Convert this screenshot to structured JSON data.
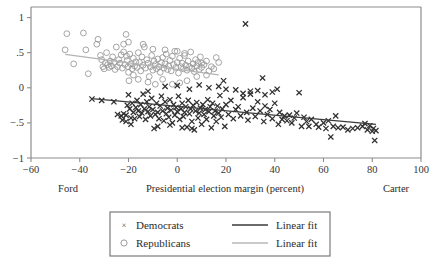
{
  "chart_data": {
    "type": "scatter",
    "title": "",
    "xlabel": "Presidential election margin (percent)",
    "ylabel": "",
    "xlim": [
      -60,
      100
    ],
    "ylim": [
      -1,
      1.15
    ],
    "xticks": [
      -60,
      -40,
      -20,
      0,
      20,
      40,
      60,
      80,
      100
    ],
    "xtick_labels": [
      "−60",
      "−40",
      "−20",
      "0",
      "20",
      "40",
      "60",
      "80",
      "100"
    ],
    "yticks": [
      1,
      0.5,
      0,
      -0.5,
      -1
    ],
    "ytick_labels": [
      "1",
      ".5",
      "0",
      "−.5",
      "−1"
    ],
    "grid": false,
    "axis_end_labels": {
      "left": "Ford",
      "right": "Carter"
    },
    "legend": {
      "position": "below-plot",
      "entries": [
        {
          "label": "Democrats",
          "marker": "x",
          "color": "#2f2f2f"
        },
        {
          "label": "Republicans",
          "marker": "o",
          "color": "#9a9a9a"
        },
        {
          "label": "Linear fit",
          "marker": "line",
          "color": "#3a3a3a"
        },
        {
          "label": "Linear fit",
          "marker": "line",
          "color": "#b3b3b3"
        }
      ]
    },
    "series": [
      {
        "name": "Republicans",
        "marker": "o",
        "color": "#9a9a9a",
        "points": [
          [
            -46.0,
            0.54
          ],
          [
            -45.3,
            0.77
          ],
          [
            -42.5,
            0.34
          ],
          [
            -38.5,
            0.78
          ],
          [
            -37.5,
            0.54
          ],
          [
            -36.5,
            0.2
          ],
          [
            -33.0,
            0.62
          ],
          [
            -32.5,
            0.69
          ],
          [
            -31.5,
            0.46
          ],
          [
            -31.0,
            0.4
          ],
          [
            -30.5,
            0.3
          ],
          [
            -30.0,
            0.27
          ],
          [
            -29.5,
            0.35
          ],
          [
            -29.0,
            0.5
          ],
          [
            -28.5,
            0.33
          ],
          [
            -28.0,
            0.29
          ],
          [
            -27.5,
            0.38
          ],
          [
            -27.0,
            0.31
          ],
          [
            -26.5,
            0.44
          ],
          [
            -26.0,
            0.36
          ],
          [
            -25.5,
            0.26
          ],
          [
            -25.0,
            0.58
          ],
          [
            -24.5,
            0.3
          ],
          [
            -24.0,
            0.4
          ],
          [
            -23.5,
            0.35
          ],
          [
            -23.0,
            0.47
          ],
          [
            -22.5,
            0.28
          ],
          [
            -22.0,
            0.51
          ],
          [
            -21.5,
            0.33
          ],
          [
            -21.0,
            0.76
          ],
          [
            -20.8,
            0.45
          ],
          [
            -20.5,
            0.39
          ],
          [
            -20.2,
            0.3
          ],
          [
            -20.0,
            0.22
          ],
          [
            -19.8,
            0.1
          ],
          [
            -19.5,
            0.48
          ],
          [
            -19.0,
            0.34
          ],
          [
            -18.5,
            0.27
          ],
          [
            -18.0,
            0.42
          ],
          [
            -17.5,
            0.31
          ],
          [
            -17.0,
            0.37
          ],
          [
            -16.5,
            0.29
          ],
          [
            -16.0,
            0.5
          ],
          [
            -15.5,
            0.36
          ],
          [
            -15.0,
            0.24
          ],
          [
            -14.5,
            0.44
          ],
          [
            -14.0,
            0.32
          ],
          [
            -13.5,
            0.58
          ],
          [
            -13.0,
            0.28
          ],
          [
            -12.5,
            0.4
          ],
          [
            -12.0,
            0.35
          ],
          [
            -11.5,
            0.16
          ],
          [
            -11.0,
            0.3
          ],
          [
            -10.5,
            0.46
          ],
          [
            -10.0,
            0.25
          ],
          [
            -9.5,
            0.38
          ],
          [
            -9.0,
            0.33
          ],
          [
            -8.5,
            0.27
          ],
          [
            -8.0,
            0.41
          ],
          [
            -7.5,
            0.3
          ],
          [
            -7.0,
            0.22
          ],
          [
            -6.5,
            0.36
          ],
          [
            -6.0,
            0.43
          ],
          [
            -5.5,
            0.28
          ],
          [
            -5.0,
            0.34
          ],
          [
            -4.5,
            0.48
          ],
          [
            -4.0,
            0.26
          ],
          [
            -3.5,
            0.31
          ],
          [
            -3.0,
            0.39
          ],
          [
            -2.5,
            0.24
          ],
          [
            -2.0,
            0.45
          ],
          [
            -1.5,
            0.33
          ],
          [
            -1.0,
            0.52
          ],
          [
            -0.5,
            0.29
          ],
          [
            0.0,
            0.36
          ],
          [
            0.5,
            0.21
          ],
          [
            1.0,
            0.42
          ],
          [
            1.5,
            0.3
          ],
          [
            2.0,
            0.35
          ],
          [
            2.5,
            0.27
          ],
          [
            3.0,
            0.46
          ],
          [
            3.5,
            0.32
          ],
          [
            4.0,
            0.25
          ],
          [
            4.5,
            0.38
          ],
          [
            5.0,
            0.3
          ],
          [
            5.5,
            0.51
          ],
          [
            6.0,
            0.28
          ],
          [
            6.5,
            0.34
          ],
          [
            7.0,
            0.23
          ],
          [
            7.5,
            0.4
          ],
          [
            8.0,
            0.31
          ],
          [
            8.5,
            0.36
          ],
          [
            9.0,
            0.26
          ],
          [
            9.5,
            0.44
          ],
          [
            10.0,
            0.29
          ],
          [
            11.0,
            0.33
          ],
          [
            12.0,
            0.38
          ],
          [
            13.0,
            0.24
          ],
          [
            14.0,
            0.3
          ],
          [
            15.0,
            0.27
          ],
          [
            16.0,
            0.43
          ],
          [
            17.0,
            0.36
          ],
          [
            -20.0,
            0.65
          ],
          [
            -22.0,
            0.62
          ],
          [
            -18.0,
            0.18
          ],
          [
            -16.0,
            0.12
          ],
          [
            -12.0,
            0.08
          ],
          [
            -9.0,
            0.05
          ],
          [
            -6.0,
            0.12
          ],
          [
            -2.0,
            0.05
          ],
          [
            1.0,
            0.07
          ],
          [
            4.0,
            0.1
          ],
          [
            8.0,
            0.16
          ],
          [
            12.0,
            0.18
          ],
          [
            -14.0,
            0.62
          ],
          [
            -10.0,
            0.55
          ],
          [
            -5.0,
            0.54
          ],
          [
            0.0,
            0.52
          ],
          [
            3.0,
            0.49
          ],
          [
            10.0,
            0.35
          ]
        ]
      },
      {
        "name": "Democrats",
        "marker": "x",
        "color": "#2f2f2f",
        "points": [
          [
            -35.0,
            -0.16
          ],
          [
            -31.0,
            -0.18
          ],
          [
            -26.0,
            -0.2
          ],
          [
            -24.5,
            -0.38
          ],
          [
            -23.0,
            -0.4
          ],
          [
            -22.5,
            -0.46
          ],
          [
            -22.0,
            -0.37
          ],
          [
            -21.0,
            -0.39
          ],
          [
            -20.5,
            -0.25
          ],
          [
            -20.0,
            -0.1
          ],
          [
            -19.5,
            -0.3
          ],
          [
            -19.0,
            -0.43
          ],
          [
            -18.5,
            -0.22
          ],
          [
            -18.0,
            -0.35
          ],
          [
            -17.5,
            -0.44
          ],
          [
            -17.0,
            -0.28
          ],
          [
            -16.5,
            -0.18
          ],
          [
            -16.0,
            -0.33
          ],
          [
            -15.5,
            -0.41
          ],
          [
            -15.0,
            -0.24
          ],
          [
            -14.5,
            -0.36
          ],
          [
            -14.0,
            -0.09
          ],
          [
            -13.5,
            -0.3
          ],
          [
            -13.0,
            -0.45
          ],
          [
            -12.5,
            -0.2
          ],
          [
            -12.0,
            -0.34
          ],
          [
            -11.5,
            -0.27
          ],
          [
            -11.0,
            -0.4
          ],
          [
            -10.5,
            -0.15
          ],
          [
            -10.0,
            -0.31
          ],
          [
            -9.5,
            -0.58
          ],
          [
            -9.0,
            -0.38
          ],
          [
            -8.5,
            -0.22
          ],
          [
            -8.0,
            -0.35
          ],
          [
            -7.5,
            -0.44
          ],
          [
            -7.0,
            -0.26
          ],
          [
            -6.5,
            -0.12
          ],
          [
            -6.0,
            -0.33
          ],
          [
            -5.5,
            -0.47
          ],
          [
            -5.0,
            -0.2
          ],
          [
            -4.5,
            -0.37
          ],
          [
            -4.0,
            -0.29
          ],
          [
            -3.5,
            -0.42
          ],
          [
            -3.0,
            -0.17
          ],
          [
            -2.5,
            -0.32
          ],
          [
            -2.0,
            -0.5
          ],
          [
            -1.5,
            -0.24
          ],
          [
            -1.0,
            -0.39
          ],
          [
            -0.5,
            -0.28
          ],
          [
            0.0,
            -0.34
          ],
          [
            0.5,
            -0.12
          ],
          [
            1.0,
            -0.45
          ],
          [
            1.5,
            -0.3
          ],
          [
            2.0,
            -0.22
          ],
          [
            2.5,
            -0.41
          ],
          [
            3.0,
            -0.35
          ],
          [
            3.5,
            -0.27
          ],
          [
            4.0,
            -0.56
          ],
          [
            4.5,
            -0.18
          ],
          [
            5.0,
            -0.37
          ],
          [
            5.5,
            -0.3
          ],
          [
            6.0,
            -0.48
          ],
          [
            6.5,
            -0.25
          ],
          [
            7.0,
            -0.6
          ],
          [
            7.5,
            -0.33
          ],
          [
            8.0,
            -0.21
          ],
          [
            8.5,
            -0.43
          ],
          [
            9.0,
            -0.36
          ],
          [
            9.5,
            -0.29
          ],
          [
            10.0,
            -0.52
          ],
          [
            10.5,
            -0.24
          ],
          [
            11.0,
            -0.38
          ],
          [
            11.5,
            -0.31
          ],
          [
            12.0,
            -0.45
          ],
          [
            12.5,
            -0.17
          ],
          [
            13.0,
            -0.34
          ],
          [
            13.5,
            -0.27
          ],
          [
            14.0,
            -0.57
          ],
          [
            14.5,
            -0.22
          ],
          [
            15.0,
            -0.4
          ],
          [
            15.5,
            -0.33
          ],
          [
            16.0,
            -0.48
          ],
          [
            16.5,
            -0.26
          ],
          [
            17.0,
            -0.36
          ],
          [
            17.5,
            -0.11
          ],
          [
            18.0,
            -0.42
          ],
          [
            18.5,
            -0.3
          ],
          [
            19.0,
            0.1
          ],
          [
            19.5,
            -0.55
          ],
          [
            20.0,
            -0.24
          ],
          [
            21.0,
            -0.38
          ],
          [
            22.0,
            -0.18
          ],
          [
            23.0,
            -0.44
          ],
          [
            24.0,
            -0.31
          ],
          [
            25.0,
            -0.27
          ],
          [
            26.0,
            -0.4
          ],
          [
            27.0,
            -0.14
          ],
          [
            28.0,
            0.91
          ],
          [
            28.5,
            -0.35
          ],
          [
            29.0,
            -0.46
          ],
          [
            30.0,
            -0.05
          ],
          [
            31.0,
            -0.29
          ],
          [
            32.0,
            -0.41
          ],
          [
            33.0,
            -0.2
          ],
          [
            34.0,
            -0.33
          ],
          [
            35.0,
            0.14
          ],
          [
            35.5,
            -0.48
          ],
          [
            36.0,
            -0.26
          ],
          [
            37.0,
            -0.38
          ],
          [
            38.0,
            -0.31
          ],
          [
            39.0,
            -0.44
          ],
          [
            40.0,
            -0.22
          ],
          [
            41.0,
            -0.02
          ],
          [
            41.5,
            -0.52
          ],
          [
            42.0,
            -0.35
          ],
          [
            43.0,
            -0.45
          ],
          [
            44.0,
            -0.4
          ],
          [
            45.0,
            -0.47
          ],
          [
            46.0,
            -0.39
          ],
          [
            47.0,
            -0.5
          ],
          [
            48.0,
            -0.43
          ],
          [
            49.0,
            -0.36
          ],
          [
            50.0,
            -0.07
          ],
          [
            51.0,
            -0.55
          ],
          [
            52.0,
            -0.42
          ],
          [
            53.0,
            -0.48
          ],
          [
            54.0,
            -0.55
          ],
          [
            55.0,
            -0.45
          ],
          [
            57.0,
            -0.52
          ],
          [
            58.0,
            -0.56
          ],
          [
            60.0,
            -0.5
          ],
          [
            61.0,
            -0.58
          ],
          [
            62.0,
            -0.47
          ],
          [
            63.0,
            -0.7
          ],
          [
            64.0,
            -0.55
          ],
          [
            65.0,
            -0.4
          ],
          [
            66.0,
            -0.57
          ],
          [
            68.0,
            -0.56
          ],
          [
            70.0,
            -0.6
          ],
          [
            72.0,
            -0.58
          ],
          [
            74.0,
            -0.57
          ],
          [
            76.0,
            -0.55
          ],
          [
            77.0,
            -0.51
          ],
          [
            78.0,
            -0.6
          ],
          [
            79.0,
            -0.54
          ],
          [
            80.0,
            -0.62
          ],
          [
            80.5,
            -0.58
          ],
          [
            81.0,
            -0.75
          ],
          [
            81.5,
            -0.61
          ],
          [
            -21.0,
            -0.48
          ],
          [
            -19.0,
            -0.52
          ],
          [
            -8.0,
            -0.55
          ],
          [
            -3.0,
            -0.53
          ],
          [
            6.0,
            -0.58
          ],
          [
            2.0,
            -0.57
          ],
          [
            -12.0,
            -0.05
          ],
          [
            -5.0,
            0.02
          ],
          [
            0.0,
            0.03
          ],
          [
            5.0,
            -0.02
          ],
          [
            9.0,
            0.04
          ],
          [
            13.0,
            0.0
          ],
          [
            17.0,
            0.02
          ],
          [
            20.0,
            -0.02
          ],
          [
            24.0,
            -0.03
          ],
          [
            27.0,
            -0.08
          ],
          [
            30.0,
            -0.09
          ],
          [
            33.0,
            -0.04
          ],
          [
            36.0,
            -0.1
          ],
          [
            39.0,
            -0.06
          ]
        ]
      }
    ],
    "fit_lines": [
      {
        "name": "Democrats linear fit",
        "color": "#3a3a3a",
        "x": [
          -35.0,
          81.5
        ],
        "y": [
          -0.155,
          -0.52
        ]
      },
      {
        "name": "Republicans linear fit",
        "color": "#b3b3b3",
        "x": [
          -46.0,
          17.0
        ],
        "y": [
          0.475,
          0.185
        ]
      }
    ]
  }
}
